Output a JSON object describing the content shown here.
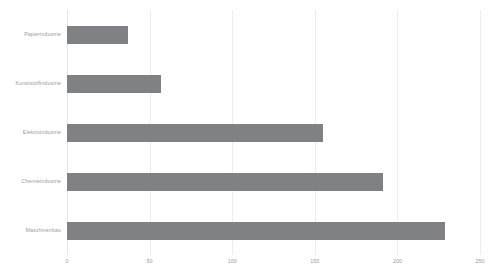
{
  "chart_data": {
    "type": "bar",
    "orientation": "horizontal",
    "title": "",
    "subtitle": "",
    "xlabel": "",
    "ylabel": "",
    "categories": [
      "Maschinenbau",
      "Chemieindustrie",
      "Elektroindustrie",
      "Kunststoffindustrie",
      "Papierindustrie"
    ],
    "values": [
      229,
      191,
      155,
      57,
      37
    ],
    "xlim": [
      0,
      250
    ],
    "xticks": [
      0,
      50,
      100,
      150,
      200,
      250
    ],
    "xtick_labels": [
      "0",
      "50",
      "100",
      "150",
      "200",
      "250"
    ],
    "grid": "vertical",
    "legend": "none",
    "series": [
      {
        "name": "",
        "color": "#808184",
        "values": [
          229,
          191,
          155,
          57,
          37
        ]
      }
    ],
    "display_order_top_to_bottom": [
      "Papierindustrie",
      "Kunststoffindustrie",
      "Elektroindustrie",
      "Chemieindustrie",
      "Maschinenbau"
    ]
  },
  "style": {
    "background": "#ffffff",
    "bar_color": "#808184",
    "grid_color": "#eceded",
    "label_color": "#9a9b9d"
  }
}
